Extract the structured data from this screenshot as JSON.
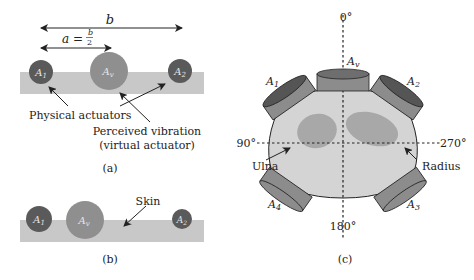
{
  "panel_a": {
    "label": "(a)",
    "dim_b": "b",
    "dim_a": "a = b/2",
    "actuators": [
      {
        "id": "A1",
        "sub": "1",
        "role": "physical"
      },
      {
        "id": "Av",
        "sub": "v",
        "role": "virtual"
      },
      {
        "id": "A2",
        "sub": "2",
        "role": "physical"
      }
    ],
    "annotation_physical": "Physical actuators",
    "annotation_perceived_line1": "Perceived vibration",
    "annotation_perceived_line2": "(virtual actuator)"
  },
  "panel_b": {
    "label": "(b)",
    "annotation_skin": "Skin",
    "actuators": [
      {
        "id": "A1",
        "sub": "1"
      },
      {
        "id": "Av",
        "sub": "v"
      },
      {
        "id": "A2",
        "sub": "2"
      }
    ]
  },
  "panel_c": {
    "label": "(c)",
    "angles": {
      "top": "0°",
      "left": "90°",
      "right": "270°",
      "bottom": "180°"
    },
    "bones": {
      "left": "Ulna",
      "right": "Radius"
    },
    "actuators": [
      {
        "id": "A1",
        "sub": "1"
      },
      {
        "id": "Av",
        "sub": "v"
      },
      {
        "id": "A2",
        "sub": "2"
      },
      {
        "id": "A3",
        "sub": "3"
      },
      {
        "id": "A4",
        "sub": "4"
      }
    ]
  },
  "colors": {
    "physical_actuator": "#5a5a5a",
    "virtual_actuator": "#8f8f8f",
    "skin": "#c8c8c8",
    "arm": "#d4d4d4",
    "bone": "#a8a8a8",
    "actuator_side": "#8c8c8c",
    "actuator_top": "#555555"
  }
}
